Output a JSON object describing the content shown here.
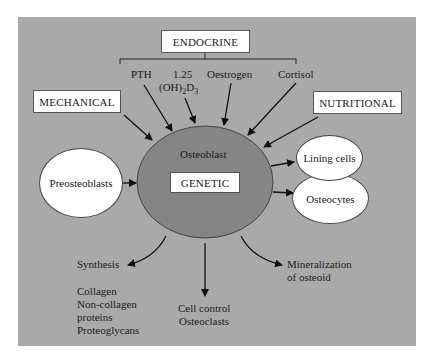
{
  "diagram": {
    "colors": {
      "panel": "#a9a9a9",
      "osteoblast_fill": "#858585",
      "box_fill": "#ffffff",
      "arrow": "#111111"
    },
    "categories": {
      "endocrine": "ENDOCRINE",
      "mechanical": "MECHANICAL",
      "nutritional": "NUTRITIONAL",
      "genetic": "GENETIC"
    },
    "endocrine_factors": {
      "pth": "PTH",
      "vitd_line1": "1.25",
      "vitd_line2_prefix": "(OH)",
      "vitd_sub1": "2",
      "vitd_mid": "D",
      "vitd_sub2": "3",
      "oestrogen": "Oestrogen",
      "cortisol": "Cortisol"
    },
    "central_cell": "Osteoblast",
    "inputs": {
      "preosteoblasts": "Preosteoblasts"
    },
    "outputs": {
      "lining_cells": "Lining cells",
      "osteocytes": "Osteocytes",
      "synthesis": "Synthesis",
      "synthesis_items": [
        "Collagen",
        "Non-collagen",
        "proteins",
        "Proteoglycans"
      ],
      "cell_control_line1": "Cell control",
      "cell_control_line2": "Osteoclasts",
      "mineralization_line1": "Mineralization",
      "mineralization_line2": "of osteoid"
    }
  }
}
